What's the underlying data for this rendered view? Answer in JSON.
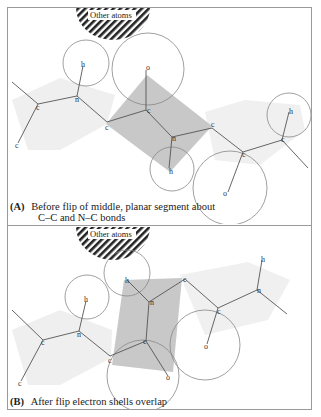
{
  "figure": {
    "panels": [
      {
        "id": "A",
        "tag": "(A)",
        "caption_line1": "Before flip of middle, planar segment about",
        "caption_line2": "C–C and N–C bonds",
        "other_atoms_label": "Other atoms",
        "atom_labels": {
          "c1": "c",
          "c2": "c",
          "n1": "n",
          "h1": "h",
          "c3": "c",
          "c4": "c",
          "o1": "o",
          "n2": "n",
          "h2": "h",
          "c5": "c",
          "c6": "c",
          "o2": "o",
          "c7": "c",
          "h3": "h"
        }
      },
      {
        "id": "B",
        "tag": "(B)",
        "caption_line1": "After flip electron shells overlap",
        "other_atoms_label": "Other atoms",
        "atom_labels": {
          "c1": "c",
          "c2": "c",
          "n1": "n",
          "h1": "h",
          "c3": "c",
          "c4": "c",
          "n2": "n",
          "h2": "h",
          "c5": "c",
          "c6": "c",
          "o1": "o",
          "o2": "o",
          "n3": "n",
          "h3": "h"
        }
      }
    ],
    "colors": {
      "frame": "#9a9a9a",
      "bond": "#555555",
      "shell": "#888888",
      "planar_segment": "#c8c8c8",
      "plane_faint": "#efefef",
      "hatch": "#222222"
    }
  }
}
